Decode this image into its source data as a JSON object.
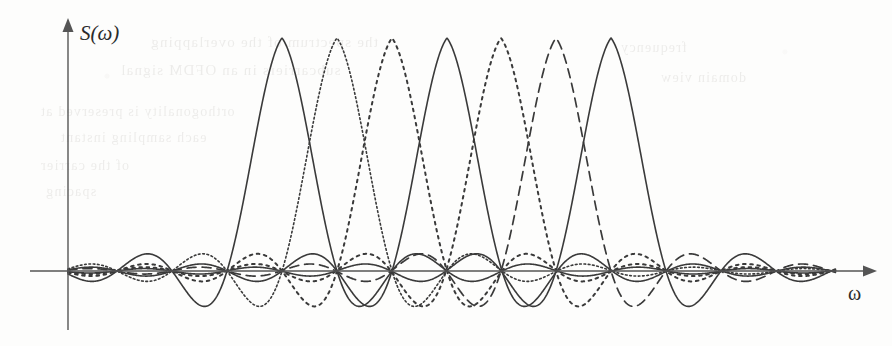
{
  "figure": {
    "kind": "line-plot",
    "caption_visible": false,
    "background_color": "#fdfdfc",
    "ink_color": "#3a3a3a",
    "axis_color": "#555555",
    "y_axis_label": "S(ω)",
    "x_axis_label": "ω",
    "ghost_text": [
      {
        "text": "the spectrum of the overlapping",
        "x": 150,
        "y": 34,
        "size": 15
      },
      {
        "text": "subcarriers in an OFDM signal",
        "x": 120,
        "y": 62,
        "size": 15
      },
      {
        "text": "orthogonality is preserved at",
        "x": 40,
        "y": 104,
        "size": 14
      },
      {
        "text": "each sampling instant",
        "x": 60,
        "y": 130,
        "size": 14
      },
      {
        "text": "of the carrier",
        "x": 40,
        "y": 158,
        "size": 14
      },
      {
        "text": "spacing",
        "x": 45,
        "y": 184,
        "size": 14
      },
      {
        "text": "frequency",
        "x": 620,
        "y": 40,
        "size": 14
      },
      {
        "text": "domain view",
        "x": 660,
        "y": 70,
        "size": 14
      }
    ]
  },
  "axes": {
    "origin_x": 68,
    "origin_y": 271,
    "x_axis_start_x": 30,
    "x_axis_end_x": 877,
    "y_axis_top_y": 18,
    "y_axis_bottom_y": 330,
    "arrow_size": 9
  },
  "chart_data": {
    "type": "line",
    "title": "",
    "xlabel": "ω",
    "ylabel": "S(ω)",
    "grid": false,
    "legend": false,
    "axis_style": "arrow-axes, no tick marks, no tick labels",
    "xlim_px": [
      30,
      877
    ],
    "ylim_px": [
      18,
      330
    ],
    "baseline_y_px": 271,
    "peak_y_px": 38,
    "amplitude_px": 233,
    "sidelobe_min_y_px": 325,
    "lobe_half_width_px": 55,
    "curve_start_x_px": 68,
    "curve_end_x_px": 836,
    "sinc_decay": 0.55,
    "series": [
      {
        "name": "subcarrier-1",
        "center_x_px": 282,
        "peak_value": 1.0,
        "line_style": "solid",
        "dash_array": "",
        "stroke_width": 1.6
      },
      {
        "name": "subcarrier-2",
        "center_x_px": 337,
        "peak_value": 1.0,
        "line_style": "fine-dotted",
        "dash_array": "1.7 2.6",
        "stroke_width": 1.6
      },
      {
        "name": "subcarrier-3",
        "center_x_px": 392,
        "peak_value": 1.0,
        "line_style": "coarse-dotted",
        "dash_array": "2.6 4.6",
        "stroke_width": 2.0
      },
      {
        "name": "subcarrier-4",
        "center_x_px": 447,
        "peak_value": 1.0,
        "line_style": "solid",
        "dash_array": "",
        "stroke_width": 1.6
      },
      {
        "name": "subcarrier-5",
        "center_x_px": 501,
        "peak_value": 1.0,
        "line_style": "coarse-dotted",
        "dash_array": "2.6 4.6",
        "stroke_width": 2.0
      },
      {
        "name": "subcarrier-6",
        "center_x_px": 556,
        "peak_value": 1.0,
        "line_style": "dashed",
        "dash_array": "9 6",
        "stroke_width": 1.7
      },
      {
        "name": "subcarrier-7",
        "center_x_px": 611,
        "peak_value": 1.0,
        "line_style": "solid",
        "dash_array": "",
        "stroke_width": 1.6
      }
    ]
  }
}
